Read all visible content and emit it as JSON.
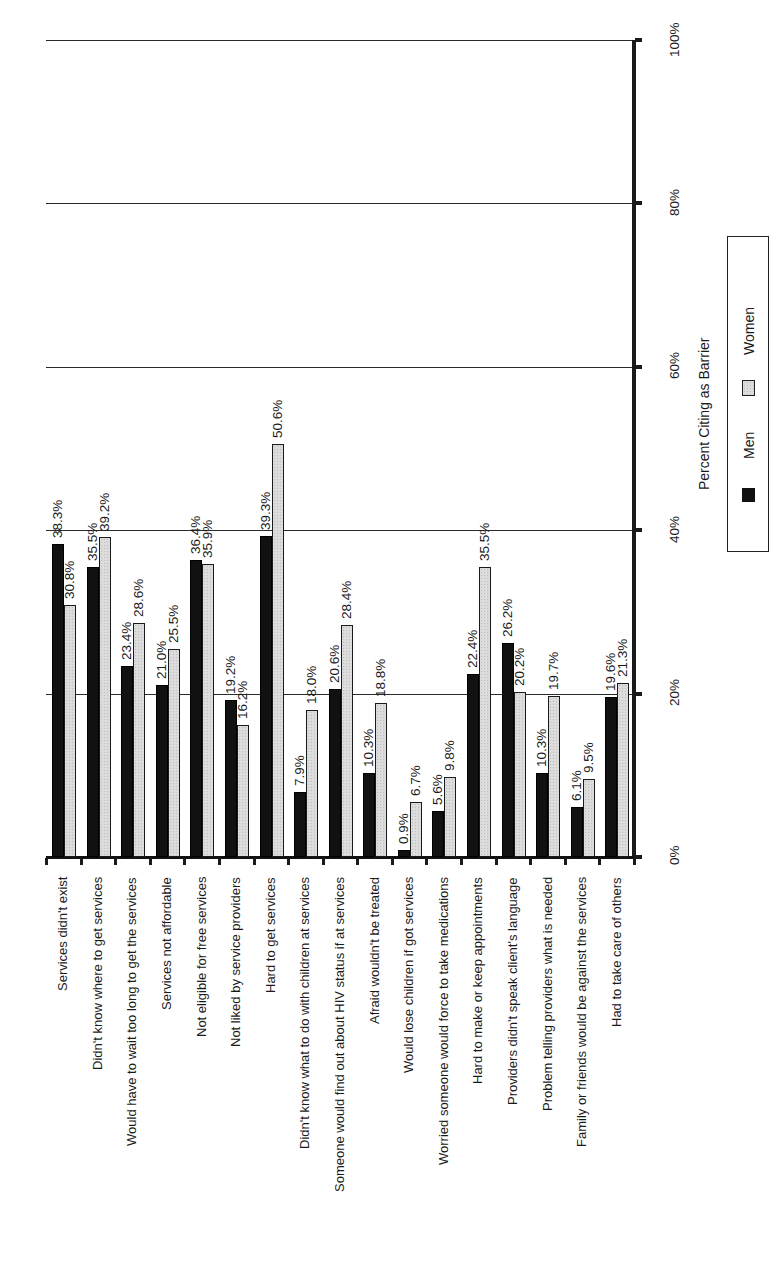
{
  "chart_data": {
    "type": "bar",
    "orientation": "vertical bars on a page rotated 90 degrees (text reads bottom-to-top)",
    "title": "",
    "xlabel": "",
    "ylabel": "Percent Citing as Barrier",
    "ylim": [
      0,
      100
    ],
    "y_ticks": [
      "0%",
      "20%",
      "40%",
      "60%",
      "80%",
      "100%"
    ],
    "grid": true,
    "legend_position": "right",
    "categories": [
      "Services didn't exist",
      "Didn't know where to get services",
      "Would have to wait too long to get the services",
      "Services not affordable",
      "Not eligible for free services",
      "Not liked by service providers",
      "Hard to get services",
      "Didn't know what to do with children at services",
      "Someone would find out about HIV status if at services",
      "Afraid wouldn't be treated",
      "Would lose children if got services",
      "Worried someone would force to take medications",
      "Hard to make or keep appointments",
      "Providers didn't speak client's language",
      "Problem telling providers what is needed",
      "Family or friends would be against the services",
      "Had to take care of others"
    ],
    "series": [
      {
        "name": "Men",
        "color": "#111111",
        "values": [
          38.3,
          35.5,
          23.4,
          21.0,
          36.4,
          19.2,
          39.3,
          7.9,
          20.6,
          10.3,
          0.9,
          5.6,
          22.4,
          26.2,
          10.3,
          6.1,
          19.6
        ],
        "labels": [
          "38.3%",
          "35.5%",
          "23.4%",
          "21.0%",
          "36.4%",
          "19.2%",
          "39.3%",
          "7.9%",
          "20.6%",
          "10.3%",
          "0.9%",
          "5.6%",
          "22.4%",
          "26.2%",
          "10.3%",
          "6.1%",
          "19.6%"
        ]
      },
      {
        "name": "Women",
        "color": "#dcdcdc",
        "values": [
          30.8,
          39.2,
          28.6,
          25.5,
          35.9,
          16.2,
          50.6,
          18.0,
          28.4,
          18.8,
          6.7,
          9.8,
          35.5,
          20.2,
          19.7,
          9.5,
          21.3
        ],
        "labels": [
          "30.8%",
          "39.2%",
          "28.6%",
          "25.5%",
          "35.9%",
          "16.2%",
          "50.6%",
          "18.0%",
          "28.4%",
          "18.8%",
          "6.7%",
          "9.8%",
          "35.5%",
          "20.2%",
          "19.7%",
          "9.5%",
          "21.3%"
        ]
      }
    ]
  },
  "axis": {
    "title": "Percent Citing as Barrier",
    "ticks": [
      "0%",
      "20%",
      "40%",
      "60%",
      "80%",
      "100%"
    ]
  },
  "legend": {
    "items": [
      {
        "label": "Men",
        "swatch": "solid-black"
      },
      {
        "label": "Women",
        "swatch": "light-stipple"
      }
    ]
  }
}
